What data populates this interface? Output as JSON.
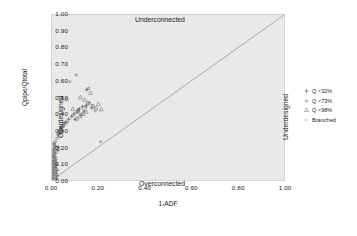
{
  "chart_data": {
    "type": "scatter",
    "title": "",
    "xlabel": "1-ADF",
    "ylabel": "Qpipe/Qtotal",
    "xlim": [
      0.0,
      1.0
    ],
    "ylim": [
      0.0,
      1.0
    ],
    "grid": false,
    "xticks": [
      "0.00",
      "0.20",
      "0.40",
      "0.60",
      "0.80",
      "1.00"
    ],
    "xtick_values": [
      0.0,
      0.2,
      0.4,
      0.6,
      0.8,
      1.0
    ],
    "yticks": [
      "0.00",
      "0.10",
      "0.20",
      "0.30",
      "0.40",
      "0.50",
      "0.60",
      "0.70",
      "0.80",
      "0.90",
      "1.00"
    ],
    "ytick_values": [
      0.0,
      0.1,
      0.2,
      0.3,
      0.4,
      0.5,
      0.6,
      0.7,
      0.8,
      0.9,
      1.0
    ],
    "reference_line": {
      "name": "one-to-one-diagonal",
      "from": [
        0.0,
        0.0
      ],
      "to": [
        1.0,
        1.0
      ],
      "color": "#8f8f8f",
      "style": "solid"
    },
    "annotations": [
      {
        "text": "Underconnected",
        "x": 0.38,
        "y": 0.96,
        "position": "top-center"
      },
      {
        "text": "Overconnected",
        "x": 0.4,
        "y": 0.02,
        "position": "bottom-center"
      },
      {
        "text": "Overdesigned",
        "x": 0.03,
        "y": 0.5,
        "position": "left-vertical"
      },
      {
        "text": "Underdesigned",
        "x": 0.98,
        "y": 0.5,
        "position": "right-vertical"
      }
    ],
    "legend": {
      "position": "right",
      "entries": [
        {
          "label": "Q <32%",
          "marker": "plus",
          "color": "#6b6b6b"
        },
        {
          "label": "Q <73%",
          "marker": "dot",
          "color": "#7a7a7a"
        },
        {
          "label": "Q <98%",
          "marker": "triangle",
          "color": "#888888"
        },
        {
          "label": "Branched",
          "marker": "dash",
          "color": "#9a9a9a"
        }
      ]
    },
    "series": [
      {
        "name": "Q <32%",
        "marker": "plus",
        "color": "#5f5f5f",
        "points": [
          [
            0.005,
            0.012
          ],
          [
            0.006,
            0.03
          ],
          [
            0.004,
            0.048
          ],
          [
            0.007,
            0.065
          ],
          [
            0.005,
            0.082
          ],
          [
            0.008,
            0.1
          ],
          [
            0.006,
            0.118
          ],
          [
            0.009,
            0.135
          ],
          [
            0.005,
            0.152
          ],
          [
            0.01,
            0.17
          ],
          [
            0.007,
            0.188
          ],
          [
            0.012,
            0.205
          ],
          [
            0.009,
            0.222
          ],
          [
            0.014,
            0.16
          ],
          [
            0.011,
            0.143
          ],
          [
            0.016,
            0.128
          ],
          [
            0.013,
            0.112
          ],
          [
            0.018,
            0.095
          ],
          [
            0.015,
            0.075
          ],
          [
            0.02,
            0.058
          ],
          [
            0.017,
            0.04
          ],
          [
            0.022,
            0.025
          ],
          [
            0.019,
            0.008
          ],
          [
            0.025,
            0.178
          ],
          [
            0.028,
            0.198
          ],
          [
            0.033,
            0.3
          ],
          [
            0.041,
            0.318
          ],
          [
            0.047,
            0.332
          ],
          [
            0.052,
            0.345
          ],
          [
            0.06,
            0.352
          ],
          [
            0.072,
            0.368
          ],
          [
            0.085,
            0.386
          ],
          [
            0.095,
            0.4
          ],
          [
            0.108,
            0.412
          ],
          [
            0.118,
            0.43
          ],
          [
            0.132,
            0.444
          ],
          [
            0.148,
            0.452
          ],
          [
            0.16,
            0.468
          ],
          [
            0.172,
            0.438
          ],
          [
            0.15,
            0.548
          ],
          [
            0.138,
            0.418
          ],
          [
            0.125,
            0.392
          ],
          [
            0.112,
            0.424
          ],
          [
            0.1,
            0.368
          ]
        ]
      },
      {
        "name": "Q <73%",
        "marker": "dot",
        "color": "#767676",
        "points": [
          [
            0.003,
            0.018
          ],
          [
            0.004,
            0.036
          ],
          [
            0.006,
            0.054
          ],
          [
            0.003,
            0.072
          ],
          [
            0.007,
            0.09
          ],
          [
            0.005,
            0.108
          ],
          [
            0.009,
            0.126
          ],
          [
            0.006,
            0.144
          ],
          [
            0.01,
            0.162
          ],
          [
            0.008,
            0.18
          ],
          [
            0.012,
            0.196
          ],
          [
            0.01,
            0.214
          ],
          [
            0.014,
            0.232
          ],
          [
            0.021,
            0.252
          ],
          [
            0.026,
            0.272
          ],
          [
            0.03,
            0.29
          ],
          [
            0.036,
            0.308
          ],
          [
            0.044,
            0.324
          ],
          [
            0.055,
            0.336
          ],
          [
            0.066,
            0.348
          ],
          [
            0.015,
            0.12
          ],
          [
            0.018,
            0.086
          ],
          [
            0.023,
            0.062
          ],
          [
            0.013,
            0.044
          ],
          [
            0.011,
            0.024
          ],
          [
            0.008,
            0.006
          ],
          [
            0.077,
            0.596
          ],
          [
            0.105,
            0.636
          ],
          [
            0.158,
            0.556
          ],
          [
            0.146,
            0.44
          ],
          [
            0.128,
            0.398
          ],
          [
            0.116,
            0.41
          ],
          [
            0.172,
            0.452
          ],
          [
            0.186,
            0.42
          ],
          [
            0.21,
            0.232
          ]
        ]
      },
      {
        "name": "Q <98%",
        "marker": "triangle",
        "color": "#8a8a8a",
        "points": [
          [
            0.004,
            0.02
          ],
          [
            0.005,
            0.045
          ],
          [
            0.007,
            0.07
          ],
          [
            0.006,
            0.095
          ],
          [
            0.009,
            0.12
          ],
          [
            0.008,
            0.145
          ],
          [
            0.011,
            0.168
          ],
          [
            0.01,
            0.19
          ],
          [
            0.013,
            0.21
          ],
          [
            0.029,
            0.284
          ],
          [
            0.038,
            0.312
          ],
          [
            0.048,
            0.33
          ],
          [
            0.063,
            0.49
          ],
          [
            0.09,
            0.43
          ],
          [
            0.122,
            0.5
          ],
          [
            0.14,
            0.486
          ],
          [
            0.154,
            0.468
          ],
          [
            0.166,
            0.528
          ],
          [
            0.178,
            0.448
          ],
          [
            0.19,
            0.436
          ],
          [
            0.148,
            0.414
          ],
          [
            0.134,
            0.4
          ],
          [
            0.12,
            0.386
          ],
          [
            0.108,
            0.372
          ],
          [
            0.2,
            0.46
          ],
          [
            0.212,
            0.428
          ]
        ]
      },
      {
        "name": "Branched",
        "marker": "dash",
        "color": "#9a9a9a",
        "points": [
          [
            0.006,
            0.015
          ],
          [
            0.008,
            0.052
          ],
          [
            0.005,
            0.088
          ],
          [
            0.01,
            0.124
          ],
          [
            0.007,
            0.158
          ],
          [
            0.012,
            0.192
          ],
          [
            0.009,
            0.218
          ],
          [
            0.016,
            0.14
          ],
          [
            0.014,
            0.104
          ],
          [
            0.018,
            0.068
          ],
          [
            0.011,
            0.034
          ]
        ]
      }
    ]
  }
}
